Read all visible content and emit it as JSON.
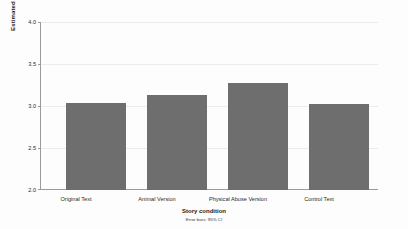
{
  "chart_data": {
    "type": "bar",
    "title": "",
    "subtitle": "",
    "categories": [
      "Original Text",
      "Animal Version",
      "Physical Abuse Version",
      "Control Text"
    ],
    "values": [
      3.04,
      3.13,
      3.27,
      3.02
    ],
    "series": [
      {
        "name": "Estimated Marginal Means",
        "values": [
          3.04,
          3.13,
          3.27,
          3.02
        ],
        "error_low": [
          2.87,
          2.99,
          3.11,
          2.85
        ],
        "error_high": [
          3.17,
          3.26,
          3.4,
          3.16
        ]
      }
    ],
    "error_bars": {
      "type": "95% CI",
      "low": [
        2.87,
        2.99,
        3.11,
        2.85
      ],
      "high": [
        3.17,
        3.26,
        3.4,
        3.16
      ]
    },
    "xlabel": "Story condition",
    "ylabel": "Estimated Marginal Means",
    "ylim": [
      2.0,
      4.0
    ],
    "yticks": [
      "2.0",
      "2.5",
      "3.0",
      "3.5",
      "4.0"
    ],
    "ytick_values": [
      2.0,
      2.5,
      3.0,
      3.5,
      4.0
    ],
    "grid": true,
    "legend": "none",
    "annotation": "Error bars: 95% CI",
    "bar_color": "#6e6e6e",
    "error_bar_color": "#1f1f1f",
    "gridline_color": "#ececec",
    "axis_color": "#9a9a9a",
    "background_color": "#fdfdfd"
  }
}
